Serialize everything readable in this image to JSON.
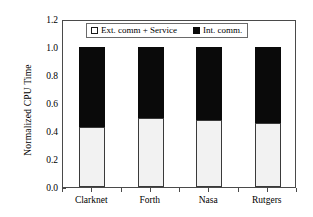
{
  "chart_data": {
    "type": "bar",
    "subtype": "stacked-bar",
    "title": "",
    "xlabel": "",
    "ylabel": "Normalized CPU Time",
    "categories": [
      "Clarknet",
      "Forth",
      "Nasa",
      "Rutgers"
    ],
    "ylim": [
      0.0,
      1.2
    ],
    "yticks": [
      "0.0",
      "0.2",
      "0.4",
      "0.6",
      "0.8",
      "1.0",
      "1.2"
    ],
    "ytick_values": [
      0.0,
      0.2,
      0.4,
      0.6,
      0.8,
      1.0,
      1.2
    ],
    "grid": false,
    "legend_position": "top-center-inside",
    "series": [
      {
        "name": "Ext. comm + Service",
        "color": "#f2f2f2",
        "swatch": "open-square",
        "values": [
          0.43,
          0.49,
          0.48,
          0.46
        ]
      },
      {
        "name": "Int. comm.",
        "color": "#0a0a0a",
        "swatch": "filled-square",
        "values": [
          0.57,
          0.51,
          0.52,
          0.54
        ]
      }
    ],
    "totals": [
      1.0,
      1.0,
      1.0,
      1.0
    ]
  },
  "legend": {
    "items": [
      {
        "label": "Ext. comm + Service"
      },
      {
        "label": "Int. comm."
      }
    ]
  },
  "axes": {
    "y_title": "Normalized CPU Time"
  }
}
